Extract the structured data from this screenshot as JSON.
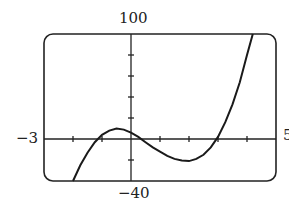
{
  "chart_data": {
    "type": "line",
    "title": "",
    "xlabel": "",
    "ylabel": "",
    "xlim": [
      -3,
      5
    ],
    "ylim": [
      -40,
      100
    ],
    "x_tick_step": 1,
    "y_tick_step": 20,
    "grid": false,
    "window_labels": {
      "xmin": "−3",
      "xmax": "5",
      "ymin": "−40",
      "ymax": "100"
    },
    "series": [
      {
        "name": "f(x)",
        "x": [
          -2.0,
          -1.75,
          -1.5,
          -1.25,
          -1.0,
          -0.75,
          -0.5,
          -0.25,
          0.0,
          0.25,
          0.5,
          0.75,
          1.0,
          1.25,
          1.5,
          1.75,
          2.0,
          2.25,
          2.5,
          2.75,
          3.0,
          3.25,
          3.5,
          3.75,
          4.0,
          4.2
        ],
        "y": [
          -40,
          -25,
          -13,
          -3,
          4,
          8,
          10,
          9,
          6,
          2,
          -3,
          -8,
          -12,
          -16,
          -19,
          -20.5,
          -21,
          -19,
          -15,
          -8,
          2,
          16,
          33,
          54,
          80,
          100
        ]
      }
    ]
  }
}
